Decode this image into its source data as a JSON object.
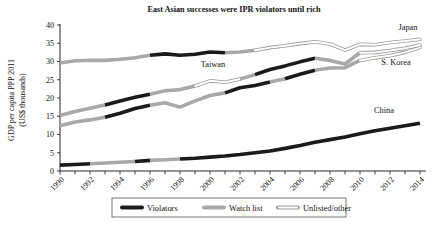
{
  "chart_data": {
    "type": "line",
    "title": "East Asian successes were IPR violators until rich",
    "xlabel": "",
    "ylabel": "GDP per capita PPP 2011\n(US$ thousands)",
    "ylabel_line1": "GDP per capita PPP 2011",
    "ylabel_line2": "(US$ thousands)",
    "grid": false,
    "legend_position": "bottom",
    "xlim": [
      1990,
      2014
    ],
    "ylim": [
      0,
      40
    ],
    "yticks": [
      0,
      5,
      10,
      15,
      20,
      25,
      30,
      35,
      40
    ],
    "ytick_labels": [
      "0",
      "5",
      "10",
      "15",
      "20",
      "25",
      "30",
      "35",
      "40"
    ],
    "xticks": [
      1990,
      1991,
      1992,
      1993,
      1994,
      1995,
      1996,
      1997,
      1998,
      1999,
      2000,
      2001,
      2002,
      2003,
      2004,
      2005,
      2006,
      2007,
      2008,
      2009,
      2010,
      2011,
      2012,
      2013,
      2014
    ],
    "xtick_labels": [
      "1990",
      "1992",
      "1994",
      "1996",
      "1998",
      "2000",
      "2002",
      "2004",
      "2006",
      "2008",
      "2010",
      "2012",
      "2014"
    ],
    "xtick_labeled_years": [
      1990,
      1992,
      1994,
      1996,
      1998,
      2000,
      2002,
      2004,
      2006,
      2008,
      2010,
      2012,
      2014
    ],
    "x": [
      1990,
      1991,
      1992,
      1993,
      1994,
      1995,
      1996,
      1997,
      1998,
      1999,
      2000,
      2001,
      2002,
      2003,
      2004,
      2005,
      2006,
      2007,
      2008,
      2009,
      2010,
      2011,
      2012,
      2013,
      2014
    ],
    "status_colors": {
      "violator": "#1a1a1a",
      "watch_list": "#a8a8a8",
      "unlisted": "#ffffff",
      "unlisted_stroke": "#9a9a9a"
    },
    "series": [
      {
        "name": "Japan",
        "label": "Japan",
        "values": [
          29.6,
          30.2,
          30.3,
          30.3,
          30.6,
          31.0,
          31.7,
          32.1,
          31.7,
          32.0,
          32.6,
          32.4,
          32.6,
          33.1,
          33.8,
          34.3,
          34.9,
          35.4,
          34.8,
          33.1,
          34.7,
          34.6,
          35.2,
          35.6,
          36.1
        ],
        "status": [
          "watch_list",
          "watch_list",
          "watch_list",
          "watch_list",
          "watch_list",
          "watch_list",
          "violator",
          "violator",
          "violator",
          "violator",
          "violator",
          "watch_list",
          "watch_list",
          "unlisted",
          "unlisted",
          "unlisted",
          "unlisted",
          "unlisted",
          "unlisted",
          "unlisted",
          "unlisted",
          "unlisted",
          "unlisted",
          "unlisted",
          "unlisted"
        ]
      },
      {
        "name": "S. Korea",
        "label": "S. Korea",
        "values": [
          12.4,
          13.4,
          14.0,
          14.7,
          15.8,
          17.1,
          18.0,
          18.7,
          17.5,
          19.2,
          20.7,
          21.4,
          22.8,
          23.4,
          24.4,
          25.3,
          26.5,
          27.6,
          28.2,
          28.3,
          30.3,
          31.0,
          31.6,
          32.5,
          33.8
        ],
        "status": [
          "watch_list",
          "watch_list",
          "watch_list",
          "violator",
          "violator",
          "violator",
          "watch_list",
          "watch_list",
          "watch_list",
          "watch_list",
          "watch_list",
          "violator",
          "violator",
          "violator",
          "watch_list",
          "violator",
          "violator",
          "watch_list",
          "watch_list",
          "watch_list",
          "unlisted",
          "unlisted",
          "unlisted",
          "unlisted",
          "unlisted"
        ]
      },
      {
        "name": "Taiwan",
        "label": "Taiwan",
        "values": [
          15.2,
          16.3,
          17.2,
          18.1,
          19.2,
          20.2,
          21.0,
          22.0,
          22.3,
          23.3,
          24.7,
          24.3,
          25.2,
          26.4,
          27.8,
          28.8,
          29.9,
          30.9,
          30.3,
          29.3,
          32.4,
          32.5,
          33.0,
          33.6,
          34.5
        ],
        "status": [
          "watch_list",
          "watch_list",
          "watch_list",
          "violator",
          "violator",
          "violator",
          "watch_list",
          "watch_list",
          "watch_list",
          "unlisted",
          "unlisted",
          "unlisted",
          "watch_list",
          "violator",
          "violator",
          "violator",
          "violator",
          "watch_list",
          "watch_list",
          "watch_list",
          "unlisted",
          "unlisted",
          "unlisted",
          "unlisted",
          "unlisted"
        ]
      },
      {
        "name": "China",
        "label": "China",
        "values": [
          1.6,
          1.8,
          2.0,
          2.2,
          2.4,
          2.6,
          2.9,
          3.1,
          3.3,
          3.5,
          3.8,
          4.1,
          4.5,
          5.0,
          5.5,
          6.2,
          7.0,
          7.9,
          8.6,
          9.3,
          10.2,
          11.0,
          11.7,
          12.4,
          13.1
        ],
        "status": [
          "violator",
          "violator",
          "watch_list",
          "watch_list",
          "watch_list",
          "violator",
          "watch_list",
          "watch_list",
          "violator",
          "violator",
          "violator",
          "violator",
          "violator",
          "violator",
          "violator",
          "violator",
          "violator",
          "violator",
          "violator",
          "violator",
          "violator",
          "violator",
          "violator",
          "violator",
          "violator"
        ]
      }
    ],
    "legend": [
      {
        "label": "Violators",
        "key": "violator",
        "color": "#1a1a1a"
      },
      {
        "label": "Watch list",
        "key": "watch_list",
        "color": "#a8a8a8"
      },
      {
        "label": "Unlisted/other",
        "key": "unlisted",
        "color": "#ffffff"
      }
    ],
    "annotations": [
      {
        "text": "Japan",
        "x": 2013.2,
        "y": 38.6
      },
      {
        "text": "S. Korea",
        "x": 2012.4,
        "y": 29.1
      },
      {
        "text": "Taiwan",
        "x": 2000.2,
        "y": 28.4
      },
      {
        "text": "China",
        "x": 2011.6,
        "y": 15.8
      }
    ]
  }
}
